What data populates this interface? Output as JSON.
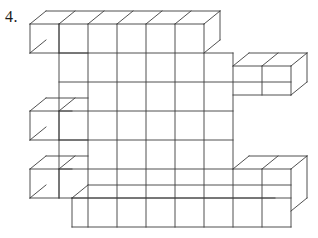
{
  "problem": {
    "number_label": "4."
  },
  "figure": {
    "name": "cube-stack-isometric-drawing",
    "stroke_color": "#3c3c3c",
    "face_color": "#ffffff",
    "background_color": "#ffffff",
    "projection": {
      "cube_width": 29,
      "cube_height": 29,
      "depth_dx": 16,
      "depth_dy": -13
    },
    "front_grid": {
      "origin_x": 59,
      "origin_y": 24,
      "columns": 6,
      "rows": 5
    },
    "left_protrusions_rows": [
      1,
      3,
      5
    ],
    "right_protrusions_rows": [
      2,
      4
    ],
    "bottom_row_offset_columns": 1,
    "counts": {
      "front_face_columns": 6,
      "front_face_rows": 5,
      "left_cubes": 3,
      "right_cubes": 2
    }
  }
}
